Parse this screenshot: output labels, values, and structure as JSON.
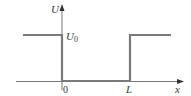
{
  "diagram": {
    "axes": {
      "y_label": "U",
      "x_label": "x"
    },
    "levels": {
      "barrier_label_main": "U",
      "barrier_label_sub": "0"
    },
    "ticks": {
      "origin": "0",
      "width": "L"
    },
    "colors": {
      "potential_line": "#7a7a7a",
      "axis": "#555555",
      "text": "#3a3a3a",
      "background": "#ffffff"
    }
  }
}
